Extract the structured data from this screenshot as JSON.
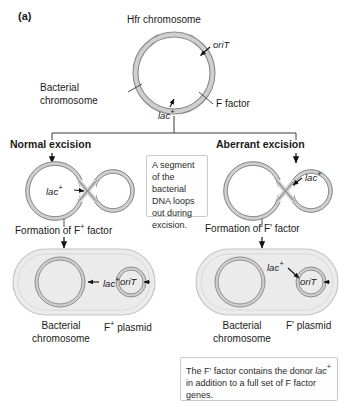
{
  "figure": {
    "panel_label": "(a)",
    "top": {
      "title": "Hfr chromosome",
      "orit_label": "oriT",
      "bacterial_chromosome_label_line1": "Bacterial",
      "bacterial_chromosome_label_line2": "chromosome",
      "f_factor_label": "F factor",
      "lac_label": "lac",
      "lac_superscript": "+"
    },
    "branches": {
      "left_heading": "Normal excision",
      "right_heading": "Aberrant excision",
      "left_lac_label": "lac",
      "left_lac_superscript": "+",
      "right_lac_label": "lac",
      "right_lac_superscript": "+",
      "left_formation": "Formation of F",
      "left_formation_sup": "+",
      "left_formation_tail": " factor",
      "right_formation": "Formation of F′ factor"
    },
    "callout_middle": "A segment of the bacterial DNA loops out during excision.",
    "callout_bottom_part1": "The F′ factor contains the donor ",
    "callout_bottom_gene": "lac",
    "callout_bottom_gene_sup": "+",
    "callout_bottom_part2": " in addition to a full set of F factor genes.",
    "left_cell": {
      "chromosome_lac_label": "lac",
      "chromosome_lac_sup": "+",
      "plasmid_orit_label": "oriT",
      "caption_line1": "Bacterial",
      "caption_line2": "chromosome",
      "plasmid_caption": "F",
      "plasmid_caption_sup": "+",
      "plasmid_caption_tail": " plasmid"
    },
    "right_cell": {
      "plasmid_lac_label": "lac",
      "plasmid_lac_sup": "+",
      "plasmid_orit_label": "oriT",
      "caption_line1": "Bacterial",
      "caption_line2": "chromosome",
      "plasmid_caption": "F′ plasmid"
    },
    "colors": {
      "dna_stroke": "#8a8a8a",
      "dna_fill": "#d4d4d4",
      "cell_fill": "#ebebeb",
      "cell_stroke": "#c4c4c4",
      "text": "#1a1a1a",
      "callout_border": "#c9c9c9",
      "arrow": "#111111"
    }
  }
}
